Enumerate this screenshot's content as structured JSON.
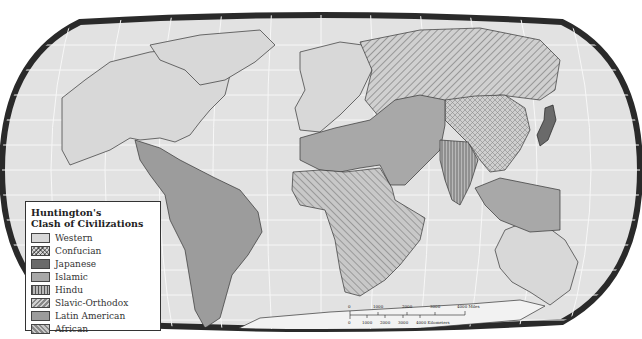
{
  "map": {
    "title": "Huntington's Clash of Civilizations",
    "projection": "Robinson (world)",
    "legend": {
      "title_line1": "Huntington's",
      "title_line2": "Clash of Civilizations",
      "items": [
        {
          "label": "Western",
          "pattern": "solid",
          "color": "#d8d8d8"
        },
        {
          "label": "Confucian",
          "pattern": "crosshatch",
          "color": "#c8c8c8"
        },
        {
          "label": "Japanese",
          "pattern": "solid-dark",
          "color": "#6a6a6a"
        },
        {
          "label": "Islamic",
          "pattern": "solid",
          "color": "#a8a8a8"
        },
        {
          "label": "Hindu",
          "pattern": "vertical-lines",
          "color": "#9a9a9a"
        },
        {
          "label": "Slavic-Orthodox",
          "pattern": "diagonal-lines",
          "color": "#bdbdbd"
        },
        {
          "label": "Latin American",
          "pattern": "solid",
          "color": "#9c9c9c"
        },
        {
          "label": "African",
          "pattern": "diagonal-lines-reverse",
          "color": "#b4b4b4"
        }
      ]
    },
    "scale_bar": {
      "miles_ticks": [
        "0",
        "1000",
        "2000",
        "3000",
        "4000 Miles"
      ],
      "km_ticks": [
        "0",
        "1000",
        "2000",
        "3000",
        "4000 Kilometers"
      ]
    },
    "colors": {
      "ocean": "#e2e2e2",
      "frame": "#2a2a2a",
      "grid": "#f4f4f4",
      "coast": "#333333"
    }
  }
}
